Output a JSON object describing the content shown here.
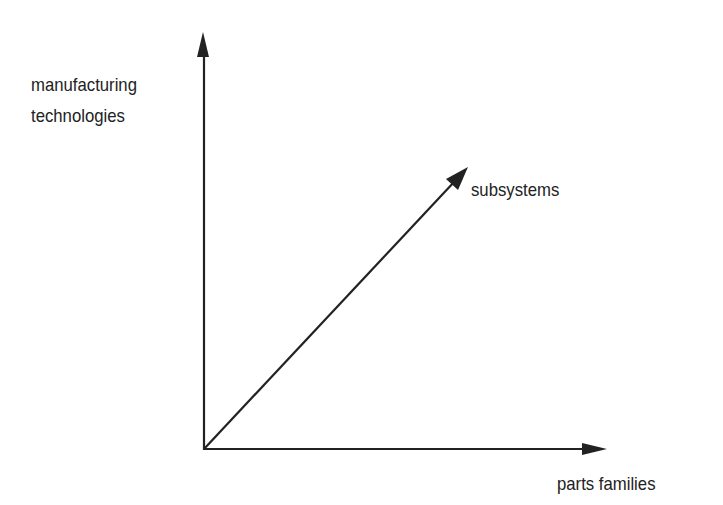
{
  "diagram": {
    "type": "3-axis coordinate diagram",
    "axes": [
      {
        "id": "vertical",
        "label_lines": [
          "manufacturing",
          "technologies"
        ]
      },
      {
        "id": "diagonal",
        "label": "subsystems"
      },
      {
        "id": "horizontal",
        "label": "parts families"
      }
    ],
    "colors": {
      "line": "#222222",
      "background": "#ffffff"
    }
  }
}
